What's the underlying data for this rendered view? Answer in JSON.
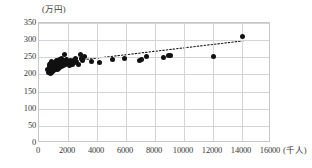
{
  "chart_data": {
    "type": "scatter",
    "title": "",
    "subtitle": "",
    "xlabel": "(千人)",
    "ylabel": "(万円)",
    "xlim": [
      0,
      16000
    ],
    "ylim": [
      0,
      350
    ],
    "grid": true,
    "legend": null,
    "x_ticks": [
      0,
      2000,
      4000,
      6000,
      8000,
      10000,
      12000,
      14000,
      16000
    ],
    "x_tick_labels": [
      "0",
      "2000",
      "4000",
      "6000",
      "8000",
      "10000",
      "12000",
      "14000",
      "16000"
    ],
    "y_ticks": [
      0,
      50,
      100,
      150,
      200,
      250,
      300,
      350
    ],
    "y_tick_labels": [
      "0",
      "50",
      "100",
      "150",
      "200",
      "250",
      "300",
      "350"
    ],
    "x_unit_suffix": "(千人)",
    "y_unit_suffix": "(万円)",
    "series": [
      {
        "name": "observations",
        "marker": "circle",
        "color": "#111111",
        "points": [
          [
            620,
            214
          ],
          [
            660,
            206
          ],
          [
            700,
            222
          ],
          [
            720,
            210
          ],
          [
            745,
            228
          ],
          [
            760,
            203
          ],
          [
            790,
            218
          ],
          [
            805,
            232
          ],
          [
            830,
            212
          ],
          [
            850,
            224
          ],
          [
            870,
            207
          ],
          [
            890,
            238
          ],
          [
            905,
            216
          ],
          [
            930,
            226
          ],
          [
            950,
            209
          ],
          [
            975,
            233
          ],
          [
            1000,
            219
          ],
          [
            1020,
            211
          ],
          [
            1045,
            229
          ],
          [
            1070,
            221
          ],
          [
            1090,
            236
          ],
          [
            1115,
            214
          ],
          [
            1140,
            226
          ],
          [
            1165,
            218
          ],
          [
            1190,
            241
          ],
          [
            1215,
            230
          ],
          [
            1240,
            222
          ],
          [
            1265,
            213
          ],
          [
            1290,
            234
          ],
          [
            1320,
            225
          ],
          [
            1350,
            217
          ],
          [
            1380,
            243
          ],
          [
            1410,
            228
          ],
          [
            1440,
            220
          ],
          [
            1470,
            236
          ],
          [
            1500,
            231
          ],
          [
            1540,
            224
          ],
          [
            1580,
            246
          ],
          [
            1620,
            233
          ],
          [
            1660,
            227
          ],
          [
            1700,
            240
          ],
          [
            1750,
            258
          ],
          [
            1790,
            235
          ],
          [
            1840,
            229
          ],
          [
            1890,
            243
          ],
          [
            1950,
            237
          ],
          [
            2010,
            231
          ],
          [
            2080,
            226
          ],
          [
            2150,
            240
          ],
          [
            2230,
            234
          ],
          [
            2310,
            228
          ],
          [
            2400,
            242
          ],
          [
            2500,
            247
          ],
          [
            2620,
            236
          ],
          [
            2750,
            230
          ],
          [
            2880,
            258
          ],
          [
            2930,
            246
          ],
          [
            3020,
            240
          ],
          [
            3150,
            252
          ],
          [
            3600,
            238
          ],
          [
            4200,
            236
          ],
          [
            5100,
            243
          ],
          [
            5900,
            247
          ],
          [
            6900,
            241
          ],
          [
            7100,
            244
          ],
          [
            7400,
            252
          ],
          [
            8600,
            249
          ],
          [
            8900,
            256
          ],
          [
            9100,
            254
          ],
          [
            12000,
            252
          ],
          [
            14000,
            310
          ]
        ]
      }
    ],
    "trendline": {
      "style": "dotted",
      "color": "#1a1a1a",
      "x_start": 700,
      "y_start": 229,
      "x_end": 14200,
      "y_end": 297
    }
  }
}
